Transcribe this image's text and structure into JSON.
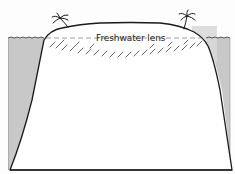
{
  "diagram": {
    "labels": {
      "lens": "Freshwater lens"
    },
    "elements": [
      {
        "name": "ocean-left",
        "kind": "water"
      },
      {
        "name": "ocean-right",
        "kind": "water"
      },
      {
        "name": "island-landmass",
        "kind": "land"
      },
      {
        "name": "freshwater-lens",
        "kind": "hatched-region"
      },
      {
        "name": "sea-level-line",
        "kind": "dashed-line"
      },
      {
        "name": "palm-tree-left",
        "kind": "icon"
      },
      {
        "name": "palm-tree-right",
        "kind": "icon"
      }
    ],
    "colors": {
      "water": "#c8c8c8",
      "outline": "#1a1a1a",
      "land": "#ffffff",
      "highlight_box": "#dcdcdc",
      "hatch": "#666666"
    }
  }
}
